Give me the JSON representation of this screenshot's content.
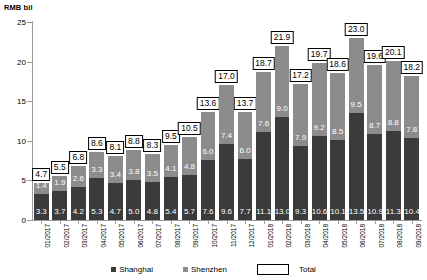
{
  "axis_unit_label": "RMB bil",
  "legend": {
    "shanghai": "Shanghai",
    "shenzhen": "Shenzhen",
    "total": "Total"
  },
  "colors": {
    "shanghai": "#3b3b3b",
    "shenzhen": "#8c8c8c",
    "total_box_fill": "#ffffff",
    "total_box_border": "#000000",
    "axis": "#9a9a9a"
  },
  "chart_data": {
    "type": "bar",
    "title": "",
    "subtitle": "",
    "xlabel": "",
    "ylabel": "RMB bil",
    "ylim": [
      0,
      25
    ],
    "yticks": [
      0,
      5,
      10,
      15,
      20,
      25
    ],
    "grid": false,
    "stacked": true,
    "legend_position": "bottom",
    "categories": [
      "01/2017",
      "02/2017",
      "03/2017",
      "04/2017",
      "05/2017",
      "06/2017",
      "07/2017",
      "08/2017",
      "09/2017",
      "10/2017",
      "11/2017",
      "12/2017",
      "01/2018",
      "02/2018",
      "03/2018",
      "04/2018",
      "05/2018",
      "06/2018",
      "07/2018",
      "08/2018",
      "09/2018"
    ],
    "series": [
      {
        "name": "Shanghai",
        "color": "#3b3b3b",
        "values": [
          3.3,
          3.7,
          4.2,
          5.3,
          4.7,
          5.0,
          4.8,
          5.4,
          5.7,
          7.6,
          9.6,
          7.7,
          11.1,
          13.0,
          9.3,
          10.6,
          10.1,
          13.5,
          10.9,
          11.3,
          10.4
        ]
      },
      {
        "name": "Shenzhen",
        "color": "#8c8c8c",
        "values": [
          1.4,
          1.9,
          2.6,
          3.3,
          3.4,
          3.8,
          3.5,
          4.1,
          4.8,
          6.0,
          7.4,
          6.0,
          7.6,
          9.0,
          7.9,
          9.2,
          8.5,
          9.5,
          8.7,
          8.8,
          7.8
        ]
      }
    ],
    "totals": [
      4.7,
      5.5,
      6.8,
      8.6,
      8.1,
      8.8,
      8.3,
      9.5,
      10.5,
      13.6,
      17.0,
      13.7,
      18.7,
      21.9,
      17.2,
      19.7,
      18.6,
      23.0,
      19.6,
      20.1,
      18.2
    ]
  }
}
